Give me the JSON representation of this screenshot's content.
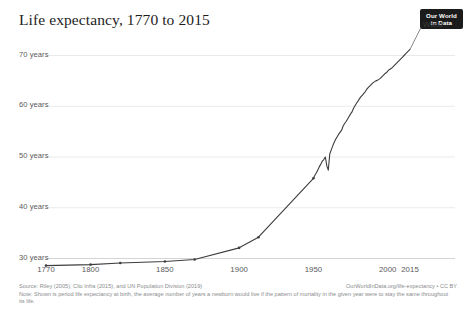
{
  "header": {
    "title": "Life expectancy, 1770 to 2015",
    "logo": {
      "line1": "Our World",
      "line2": "in Data",
      "name": "our-world-in-data-logo"
    }
  },
  "footer": {
    "source": "Source: Riley (2005), Clio Infra (2015), and UN Population Division (2019)",
    "license": "OurWorldInData.org/life-expectancy • CC BY",
    "note": "Note: Shown is period life expectancy at birth, the average number of years a newborn would live if the pattern of mortality in the given year were to stay the same throughout its life."
  },
  "chart_data": {
    "type": "line",
    "title": "Life expectancy, 1770 to 2015",
    "xlabel": "",
    "ylabel": "",
    "xlim": [
      1770,
      2015
    ],
    "ylim": [
      28.5,
      73
    ],
    "grid": "horizontal",
    "legend_position": "line-end",
    "y_ticks": [
      30,
      40,
      50,
      60,
      70
    ],
    "y_tick_labels": [
      "30 years",
      "40 years",
      "50 years",
      "60 years",
      "70 years"
    ],
    "x_ticks": [
      1770,
      1800,
      1850,
      1900,
      1950,
      2000,
      2015
    ],
    "x_tick_labels": [
      "1770",
      "1800",
      "1850",
      "1900",
      "1950",
      "2000",
      "2015"
    ],
    "series": [
      {
        "name": "World",
        "color": "#3d3d3d",
        "x": [
          1770,
          1800,
          1820,
          1850,
          1870,
          1900,
          1913,
          1950,
          1951,
          1952,
          1953,
          1954,
          1955,
          1956,
          1957,
          1958,
          1959,
          1960,
          1961,
          1962,
          1963,
          1964,
          1965,
          1966,
          1967,
          1968,
          1969,
          1970,
          1971,
          1972,
          1973,
          1974,
          1975,
          1976,
          1977,
          1978,
          1979,
          1980,
          1981,
          1982,
          1983,
          1984,
          1985,
          1986,
          1987,
          1988,
          1989,
          1990,
          1991,
          1992,
          1993,
          1994,
          1995,
          1996,
          1997,
          1998,
          1999,
          2000,
          2001,
          2002,
          2003,
          2004,
          2005,
          2006,
          2007,
          2008,
          2009,
          2010,
          2011,
          2012,
          2013,
          2014,
          2015
        ],
        "y": [
          28.5,
          28.7,
          29.0,
          29.3,
          29.7,
          32.0,
          34.1,
          45.7,
          46.3,
          46.8,
          47.4,
          48.0,
          48.5,
          49.1,
          49.4,
          49.9,
          48.2,
          47.3,
          50.5,
          51.3,
          52.1,
          52.8,
          53.4,
          53.9,
          54.4,
          54.8,
          55.2,
          56.0,
          56.5,
          56.9,
          57.4,
          57.9,
          58.4,
          58.8,
          59.5,
          60.0,
          60.5,
          60.9,
          61.4,
          61.8,
          62.1,
          62.5,
          62.8,
          63.3,
          63.6,
          63.9,
          64.2,
          64.5,
          64.7,
          64.9,
          65.0,
          65.2,
          65.4,
          65.7,
          66.0,
          66.3,
          66.5,
          66.8,
          67.1,
          67.3,
          67.5,
          67.8,
          68.1,
          68.4,
          68.7,
          69.0,
          69.3,
          69.6,
          69.9,
          70.2,
          70.5,
          70.8,
          71.1
        ]
      }
    ]
  },
  "series_label": "World"
}
